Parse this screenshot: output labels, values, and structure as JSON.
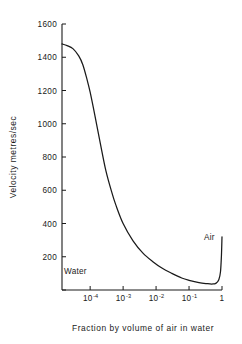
{
  "chart_data": {
    "type": "line",
    "title": "",
    "xlabel": "Fraction by volume of air in water",
    "ylabel": "Velocity metres/sec",
    "xscale": "log",
    "yscale": "linear",
    "xlim": [
      1.4e-05,
      1.0
    ],
    "ylim": [
      0,
      1600
    ],
    "grid": false,
    "legend": null,
    "y_ticks": [
      0,
      200,
      400,
      600,
      800,
      1000,
      1200,
      1400,
      1600
    ],
    "y_tick_labels": [
      "",
      "200",
      "400",
      "600",
      "800",
      "1000",
      "1200",
      "1400",
      "1600"
    ],
    "x_ticks": [
      0.0001,
      0.001,
      0.01,
      0.1,
      1
    ],
    "x_tick_labels": [
      "10^-4",
      "10^-3",
      "10^-2",
      "10^-1",
      "1"
    ],
    "x_tick_mantissa": [
      "10",
      "10",
      "10",
      "10",
      "1"
    ],
    "x_tick_exponent": [
      "-4",
      "-3",
      "-2",
      "-1",
      ""
    ],
    "series": [
      {
        "name": "sound velocity in air-water mixture",
        "color": "#1a1a1a",
        "x": [
          1.4e-05,
          2e-05,
          3e-05,
          4.5e-05,
          6e-05,
          8e-05,
          0.0001,
          0.00014,
          0.0002,
          0.0003,
          0.00045,
          0.0006,
          0.001,
          0.002,
          0.004,
          0.008,
          0.015,
          0.03,
          0.06,
          0.1,
          0.2,
          0.35,
          0.5,
          0.65,
          0.8,
          0.9,
          0.96,
          1.0
        ],
        "y": [
          1480,
          1470,
          1452,
          1408,
          1355,
          1268,
          1190,
          1048,
          890,
          718,
          590,
          512,
          400,
          296,
          222,
          170,
          132,
          100,
          72,
          58,
          44,
          38,
          36,
          40,
          62,
          110,
          205,
          320
        ]
      }
    ],
    "annotations": [
      {
        "text": "Water",
        "x_px": 64,
        "y_px": 274
      },
      {
        "text": "Air",
        "x_px": 204,
        "y_px": 240
      }
    ]
  },
  "axes": {
    "plot_left_px": 62,
    "plot_right_px": 222,
    "plot_top_px": 24,
    "plot_bottom_px": 290
  }
}
